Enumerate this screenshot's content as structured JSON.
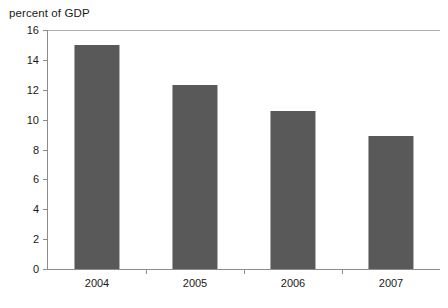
{
  "chart_data": {
    "type": "bar",
    "title": "percent of GDP",
    "xlabel": "",
    "ylabel": "",
    "categories": [
      "2004",
      "2005",
      "2006",
      "2007"
    ],
    "values": [
      15.0,
      12.3,
      10.6,
      8.9
    ],
    "ylim": [
      0,
      16
    ],
    "ytick_step": 2,
    "yticks": [
      "0",
      "2",
      "4",
      "6",
      "8",
      "10",
      "12",
      "14",
      "16"
    ],
    "grid": false,
    "legend": null,
    "bar_color": "#595959",
    "axis_color": "#8c8c8c",
    "background_color": "#ffffff",
    "text_color": "#1a1a1a"
  }
}
